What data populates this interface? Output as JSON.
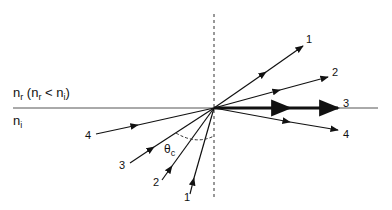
{
  "diagram": {
    "media": {
      "upper_label": "n",
      "upper_sub": "r",
      "upper_condition_prefix": " (n",
      "upper_condition_sub1": "r",
      "upper_condition_mid": " < n",
      "upper_condition_sub2": "i",
      "upper_condition_suffix": ")",
      "lower_label": "n",
      "lower_sub": "i"
    },
    "angle_label": "θ",
    "angle_sub": "c",
    "incident_rays": [
      {
        "id": "1",
        "label": "1"
      },
      {
        "id": "2",
        "label": "2"
      },
      {
        "id": "3",
        "label": "3"
      },
      {
        "id": "4",
        "label": "4"
      }
    ],
    "outgoing_rays": [
      {
        "id": "1",
        "label": "1",
        "kind": "refracted"
      },
      {
        "id": "2",
        "label": "2",
        "kind": "refracted"
      },
      {
        "id": "3",
        "label": "3",
        "kind": "critical (along interface)"
      },
      {
        "id": "4",
        "label": "4",
        "kind": "totally internally reflected"
      }
    ],
    "colors": {
      "line": "#111111",
      "interface": "#555555",
      "normal": "#333333"
    }
  }
}
